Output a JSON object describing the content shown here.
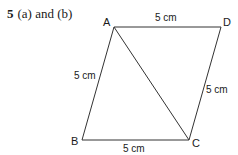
{
  "heading": {
    "number": "5",
    "text": "(a) and (b)"
  },
  "diagram": {
    "vertices": {
      "A": {
        "label": "A",
        "x": 114,
        "y": 27
      },
      "D": {
        "label": "D",
        "x": 221,
        "y": 27
      },
      "B": {
        "label": "B",
        "x": 82,
        "y": 140
      },
      "C": {
        "label": "C",
        "x": 189,
        "y": 140
      }
    },
    "measurements": {
      "AD": "5 cm",
      "AB": "5 cm",
      "DC": "5 cm",
      "BC": "5 cm"
    },
    "line_color": "#333333"
  }
}
